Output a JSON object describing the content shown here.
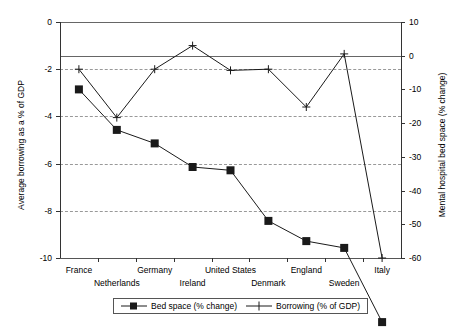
{
  "chart_data": {
    "type": "line",
    "title": "",
    "categories": [
      "France",
      "Netherlands",
      "Germany",
      "Ireland",
      "United States",
      "Denmark",
      "England",
      "Sweden",
      "Italy"
    ],
    "series": [
      {
        "name": "Bed space  (% change)",
        "axis": "right",
        "marker": "filled-square",
        "values": [
          -10,
          -22,
          -26,
          -33,
          -34,
          -49,
          -55,
          -57,
          -79
        ]
      },
      {
        "name": "Borrowing (% of GDP)",
        "axis": "left",
        "marker": "plus",
        "values": [
          -2.0,
          -4.05,
          -2.0,
          -1.0,
          -2.05,
          -2.0,
          -3.6,
          -1.35,
          -10.0
        ]
      }
    ],
    "left_axis": {
      "label": "Average borrowing as a % of GDP",
      "ticks": [
        0,
        -2,
        -4,
        -6,
        -8,
        -10
      ],
      "ylim": [
        -10,
        0
      ],
      "grid": true
    },
    "right_axis": {
      "label": "Mental hospital bed space (% change)",
      "ticks": [
        10,
        0,
        -10,
        -20,
        -30,
        -40,
        -50,
        -60
      ],
      "ylim": [
        -60,
        10
      ],
      "grid": false
    },
    "xlabel": "",
    "legend_position": "bottom",
    "legend": [
      "Bed space  (% change)",
      "Borrowing (% of GDP)"
    ]
  },
  "axes": {
    "left_title": "Average borrowing as a % of GDP",
    "right_title": "Mental hospital bed space (% change)",
    "left_ticks": [
      "0",
      "-2",
      "-4",
      "-6",
      "-8",
      "-10"
    ],
    "right_ticks": [
      "10",
      "0",
      "-10",
      "-20",
      "-30",
      "-40",
      "-50",
      "-60"
    ],
    "categories": [
      "France",
      "Netherlands",
      "Germany",
      "Ireland",
      "United States",
      "Denmark",
      "England",
      "Sweden",
      "Italy"
    ]
  },
  "legend": {
    "items": [
      {
        "label": "Bed space  (% change)",
        "marker": "filled-square-line"
      },
      {
        "label": "Borrowing (% of GDP)",
        "marker": "plus-line"
      }
    ]
  },
  "colors": {
    "line": "#1a1a1a",
    "grid": "#999999",
    "frame": "#555555",
    "background": "#ffffff"
  }
}
